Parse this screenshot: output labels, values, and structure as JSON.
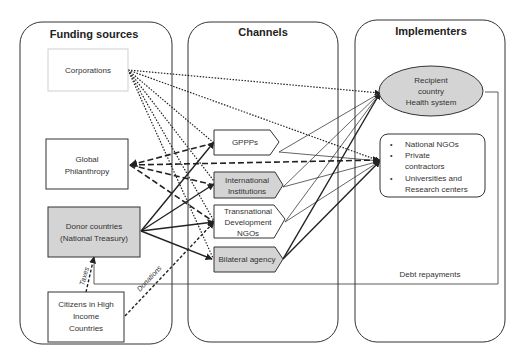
{
  "columns": {
    "funding": {
      "title": "Funding sources"
    },
    "channels": {
      "title": "Channels"
    },
    "implementers": {
      "title": "Implementers"
    }
  },
  "funding_sources": {
    "corporations": {
      "label": "Corporations"
    },
    "philanthropy": {
      "line1": "Global",
      "line2": "Philanthropy"
    },
    "donor_countries": {
      "line1": "Donor countries",
      "line2": "(National Treasury)"
    },
    "citizens": {
      "line1": "Citizens in High",
      "line2": "Income",
      "line3": "Countries"
    }
  },
  "channels": {
    "gppps": {
      "label": "GPPPs"
    },
    "international": {
      "line1": "International",
      "line2": "Institutions"
    },
    "transnational": {
      "line1": "Transnational",
      "line2": "Development",
      "line3": "NGOs"
    },
    "bilateral": {
      "label": "Bilateral agency"
    }
  },
  "implementers": {
    "recipient": {
      "line1": "Recipient",
      "line2": "country",
      "line3": "Health system"
    },
    "others": {
      "bullet": "•",
      "items": [
        "National NGOs",
        "Private",
        "contractors",
        "Universities and",
        "Research centers"
      ]
    }
  },
  "flow_labels": {
    "taxes": "Taxes",
    "donations": "Donations",
    "debt": "Debt repayments"
  },
  "colors": {
    "gray_fill": "#d4d4d4",
    "line": "#222222",
    "faint_border": "#cfcfcf"
  }
}
